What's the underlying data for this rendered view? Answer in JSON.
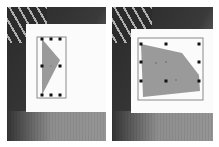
{
  "figure": {
    "panels": [
      {
        "id": "before",
        "description": "Narrow bounding box with 8 handles around a grey triangular shape",
        "canvas": {
          "x": 19,
          "y": 17,
          "w": 80,
          "h": 88
        },
        "bbox": {
          "x": 37,
          "y": 37,
          "w": 29,
          "h": 61
        },
        "shape_points": "42,39 60,60 42,95",
        "handles": [
          [
            42,
            39
          ],
          [
            51,
            39
          ],
          [
            60,
            39
          ],
          [
            42,
            65
          ],
          [
            60,
            65
          ],
          [
            42,
            95
          ],
          [
            51,
            95
          ],
          [
            60,
            95
          ]
        ],
        "center_dot": [
          51,
          65
        ]
      },
      {
        "id": "after",
        "description": "Wide bounding box with 8 handles around a grey quadrilateral shape",
        "canvas": {
          "x": 19,
          "y": 22,
          "w": 82,
          "h": 84
        },
        "bbox": {
          "x": 29,
          "y": 36,
          "w": 65,
          "h": 62
        },
        "shape_points": "40,43 81,52 98,74 99,89 42,96",
        "handles": [
          [
            40,
            43
          ],
          [
            65,
            43
          ],
          [
            98,
            43
          ],
          [
            40,
            61
          ],
          [
            98,
            61
          ],
          [
            40,
            80
          ],
          [
            65,
            80
          ],
          [
            98,
            80
          ]
        ],
        "interior_dots": [
          [
            55,
            62
          ],
          [
            65,
            61
          ],
          [
            75,
            79
          ]
        ]
      }
    ],
    "colors": {
      "shape_fill": "#9a9a9a",
      "bbox_stroke": "#8a8a8a",
      "handle": "#111111",
      "canvas": "#fbfbfb"
    }
  }
}
